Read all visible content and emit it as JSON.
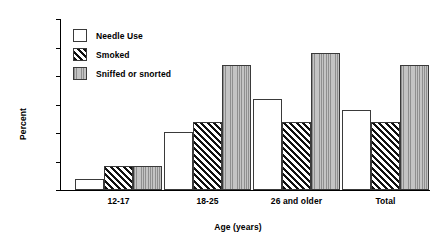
{
  "chart_data": {
    "type": "bar",
    "title": "",
    "xlabel": "Age (years)",
    "ylabel": "Percent",
    "categories": [
      "12-17",
      "18-25",
      "26 and older",
      "Total"
    ],
    "series": [
      {
        "name": "Needle Use",
        "values": [
          0.1,
          0.51,
          0.8,
          0.7
        ]
      },
      {
        "name": "Smoked",
        "values": [
          0.21,
          0.6,
          0.6,
          0.6
        ]
      },
      {
        "name": "Sniffed or snorted",
        "values": [
          0.21,
          1.1,
          1.2,
          1.1
        ]
      }
    ],
    "ylim": [
      0,
      1.5
    ],
    "ytick_labels": [
      "1.50",
      "1.25",
      "1.00",
      "0.75",
      "0.50",
      "0.25",
      "0"
    ],
    "ytick_values": [
      1.5,
      1.25,
      1.0,
      0.75,
      0.5,
      0.25,
      0
    ],
    "grid": false,
    "legend_position": "upper-left-inside"
  },
  "legend": {
    "entries": [
      {
        "label": "Needle Use",
        "pattern": "solid-white",
        "color": "#ffffff"
      },
      {
        "label": "Smoked",
        "pattern": "diagonal-hatch",
        "color": "#111111"
      },
      {
        "label": "Sniffed or snorted",
        "pattern": "vertical-lines",
        "color": "#b3b3b3"
      }
    ]
  }
}
